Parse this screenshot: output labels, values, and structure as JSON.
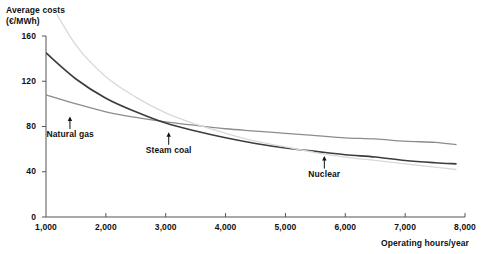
{
  "chart_data": {
    "type": "line",
    "title": "",
    "ylabel": "Average costs\n(€/MWh)",
    "xlabel": "Operating hours/year",
    "xlim": [
      1000,
      8000
    ],
    "ylim": [
      0,
      160
    ],
    "grid": false,
    "legend_position": "inline-annotations",
    "yticks": [
      "0",
      "40",
      "80",
      "120",
      "160"
    ],
    "ytick_values": [
      0,
      40,
      80,
      120,
      160
    ],
    "xticks": [
      "1,000",
      "2,000",
      "3,000",
      "4,000",
      "5,000",
      "6,000",
      "7,000",
      "8,000"
    ],
    "xtick_values": [
      1000,
      2000,
      3000,
      4000,
      5000,
      6000,
      7000,
      8000
    ],
    "x": [
      1000,
      1500,
      2000,
      2500,
      3000,
      3500,
      4000,
      4500,
      5000,
      5500,
      6000,
      6500,
      7000,
      7500,
      7850
    ],
    "series": [
      {
        "name": "Nuclear",
        "color": "#d9d9d9",
        "values": [
          196,
          152,
          124,
          106,
          92,
          82,
          74,
          67,
          62,
          57,
          53,
          50,
          47,
          44,
          42
        ],
        "annotation": {
          "label": "Nuclear",
          "x": 5650,
          "y": 49
        }
      },
      {
        "name": "Steam coal",
        "color": "#3c3c3c",
        "values": [
          145,
          122,
          105,
          93,
          83,
          76,
          70,
          65,
          61,
          58,
          55,
          53,
          50,
          48,
          47
        ],
        "annotation": {
          "label": "Steam coal",
          "x": 3050,
          "y": 70
        }
      },
      {
        "name": "Natural gas",
        "color": "#8c8c8c",
        "values": [
          108,
          100,
          93,
          88,
          84,
          81,
          78,
          76,
          74,
          72,
          70,
          69,
          67,
          66,
          64
        ],
        "annotation": {
          "label": "Natural gas",
          "x": 1400,
          "y": 84
        }
      }
    ]
  },
  "axes": {
    "y_title": "Average costs\n(€/MWh)",
    "x_title": "Operating hours/year"
  }
}
